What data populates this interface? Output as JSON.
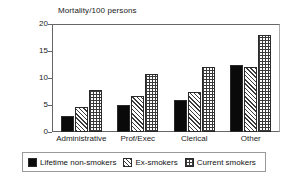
{
  "chart_data": {
    "type": "bar",
    "title": "",
    "ylabel": "Mortality/100 persons",
    "xlabel": "",
    "ylim": [
      0,
      20
    ],
    "yticks": [
      0,
      5,
      10,
      15,
      20
    ],
    "grid": false,
    "legend_position": "bottom",
    "categories": [
      "Administrative",
      "Prof/Exec",
      "Clerical",
      "Other"
    ],
    "series": [
      {
        "name": "Lifetime non-smokers",
        "pattern": "solid-black",
        "values": [
          3.0,
          5.0,
          6.0,
          12.5
        ]
      },
      {
        "name": "Ex-smokers",
        "pattern": "diagonal-hatch",
        "values": [
          4.7,
          6.7,
          7.5,
          12.0
        ]
      },
      {
        "name": "Current smokers",
        "pattern": "cross-grid-hatch",
        "values": [
          7.7,
          10.7,
          12.0,
          18.0
        ]
      }
    ]
  },
  "axis": {
    "y_title": "Mortality/100 persons",
    "ticks": [
      "20",
      "15",
      "10",
      "5",
      "0"
    ]
  },
  "xaxis": {
    "labels": [
      "Administrative",
      "Prof/Exec",
      "Clerical",
      "Other"
    ]
  },
  "legend": {
    "items": [
      {
        "label": "Lifetime non-smokers",
        "swatch": "solid-black-swatch"
      },
      {
        "label": "Ex-smokers",
        "swatch": "diagonal-hatch-swatch"
      },
      {
        "label": "Current smokers",
        "swatch": "cross-grid-hatch-swatch"
      }
    ]
  }
}
